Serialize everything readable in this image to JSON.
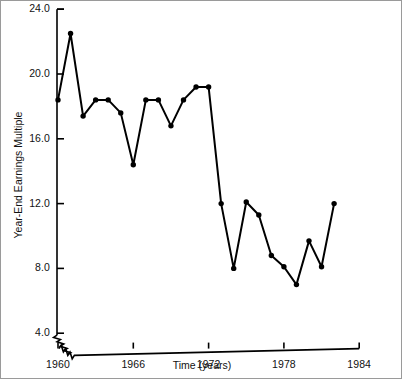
{
  "figure": {
    "background": "#ffffff",
    "frame_color": "#9a9a9a",
    "line_color": "#000000"
  },
  "axis": {
    "x_title": "Time (years)",
    "y_title": "Year-End Earnings Multiple",
    "y_ticks": [
      "4.0",
      "8.0",
      "12.0",
      "16.0",
      "20.0",
      "24.0"
    ],
    "x_ticks": [
      "1960",
      "1966",
      "1972",
      "1978",
      "1984"
    ],
    "y_break": "axis-break-symbol"
  },
  "chart_data": {
    "type": "line",
    "title": "",
    "xlabel": "Time (years)",
    "ylabel": "Year-End Earnings Multiple",
    "xlim": [
      1959,
      1984
    ],
    "ylim": [
      3.0,
      24.0
    ],
    "xticks": [
      1960,
      1966,
      1972,
      1978,
      1984
    ],
    "yticks": [
      4.0,
      8.0,
      12.0,
      16.0,
      20.0,
      24.0
    ],
    "grid": false,
    "legend": "none",
    "markers": true,
    "axis_break_y_below": 4.0,
    "x": [
      1960,
      1961,
      1962,
      1963,
      1964,
      1965,
      1966,
      1967,
      1968,
      1969,
      1970,
      1971,
      1972,
      1973,
      1974,
      1975,
      1976,
      1977,
      1978,
      1979,
      1980,
      1981,
      1982
    ],
    "y": [
      18.4,
      22.5,
      17.4,
      18.4,
      18.4,
      17.6,
      14.4,
      18.4,
      18.4,
      16.8,
      18.4,
      19.2,
      19.2,
      12.0,
      8.0,
      12.1,
      11.3,
      8.8,
      8.1,
      7.0,
      9.7,
      8.1,
      12.0
    ],
    "series": [
      {
        "name": "Year-End Earnings Multiple",
        "values": [
          18.4,
          22.5,
          17.4,
          18.4,
          18.4,
          17.6,
          14.4,
          18.4,
          18.4,
          16.8,
          18.4,
          19.2,
          19.2,
          12.0,
          8.0,
          12.1,
          11.3,
          8.8,
          8.1,
          7.0,
          9.7,
          8.1,
          12.0
        ]
      }
    ]
  }
}
